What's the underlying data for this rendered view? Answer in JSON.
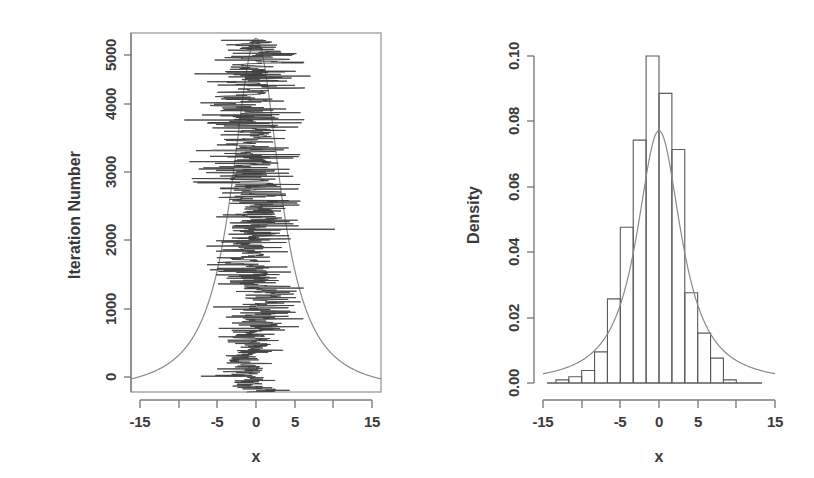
{
  "figure": {
    "title": "",
    "panels": 2
  },
  "chart_data": [
    {
      "type": "line",
      "name": "trace-plot",
      "title": "",
      "xlabel": "x",
      "ylabel": "Iteration Number",
      "xlim": [
        -18,
        18
      ],
      "ylim": [
        0,
        5100
      ],
      "xticks": [
        -15,
        -10,
        -5,
        0,
        5,
        10,
        15
      ],
      "xticklabels": [
        "-15",
        "",
        "-5",
        "0",
        "5",
        "",
        "15"
      ],
      "yticks": [
        0,
        1000,
        2000,
        3000,
        4000,
        5000
      ],
      "yticklabels": [
        "0",
        "1000",
        "2000",
        "3000",
        "4000",
        "5000"
      ],
      "grid": false,
      "legend": "none",
      "box": true,
      "overlay_curve": {
        "name": "target density (scaled)",
        "description": "Cauchy-like heavy-tailed density drawn sideways over the MCMC trace",
        "mu": 0,
        "scale": 3.4,
        "peak_x": 0
      },
      "series": [
        {
          "name": "MCMC sample path",
          "description": "Random-walk Metropolis trace of x versus iteration number, 5000 iterations",
          "n_iterations": 5000,
          "x_range_observed": [
            -14.5,
            11.5
          ]
        }
      ]
    },
    {
      "type": "bar",
      "name": "histogram",
      "title": "",
      "xlabel": "x",
      "ylabel": "Density",
      "xlim": [
        -18,
        18
      ],
      "ylim": [
        0,
        0.105
      ],
      "xticks": [
        -15,
        -10,
        -5,
        0,
        5,
        10,
        15
      ],
      "xticklabels": [
        "-15",
        "",
        "-5",
        "0",
        "5",
        "",
        "15"
      ],
      "yticks": [
        0.0,
        0.02,
        0.04,
        0.06,
        0.08,
        0.1
      ],
      "yticklabels": [
        "0.00",
        "0.02",
        "0.04",
        "0.06",
        "0.08",
        "0.10"
      ],
      "grid": false,
      "legend": "none",
      "bin_width": 2,
      "bin_edges": [
        -16,
        -14,
        -12,
        -10,
        -8,
        -6,
        -4,
        -2,
        0,
        2,
        4,
        6,
        8,
        10,
        12
      ],
      "categories": [
        "-16..-14",
        "-14..-12",
        "-12..-10",
        "-10..-8",
        "-8..-6",
        "-6..-4",
        "-4..-2",
        "-2..0",
        "0..2",
        "2..4",
        "4..6",
        "6..8",
        "8..10",
        "10..12"
      ],
      "values": [
        0.001,
        0.002,
        0.004,
        0.01,
        0.027,
        0.05,
        0.078,
        0.105,
        0.093,
        0.075,
        0.029,
        0.016,
        0.008,
        0.001
      ],
      "overlay_curve": {
        "name": "fitted density",
        "description": "Smooth unimodal density curve overlaid on the histogram",
        "peak_value": 0.081,
        "peak_x": 0,
        "mu": 0,
        "scale": 3.4
      }
    }
  ]
}
